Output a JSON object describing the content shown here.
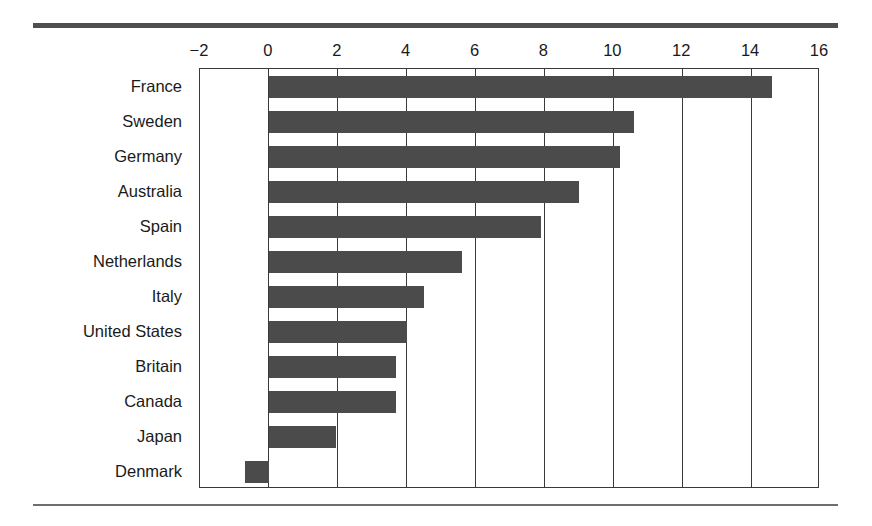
{
  "chart_data": {
    "type": "bar",
    "orientation": "horizontal",
    "title": "",
    "subtitle": "",
    "xlabel": "",
    "ylabel": "",
    "categories": [
      "France",
      "Sweden",
      "Germany",
      "Australia",
      "Spain",
      "Netherlands",
      "Italy",
      "United States",
      "Britain",
      "Canada",
      "Japan",
      "Denmark"
    ],
    "values": [
      14.6,
      10.6,
      10.2,
      9.0,
      7.9,
      5.6,
      4.5,
      4.0,
      3.7,
      3.7,
      1.95,
      -0.7
    ],
    "xlim": [
      -2,
      16
    ],
    "xticks": [
      -2,
      0,
      2,
      4,
      6,
      8,
      10,
      12,
      14,
      16
    ],
    "xtick_labels": [
      "−2",
      "0",
      "2",
      "4",
      "6",
      "8",
      "10",
      "12",
      "14",
      "16"
    ],
    "grid": "vertical-at-xticks",
    "legend": "none",
    "bar_color": "#4b4b4b",
    "frame_color": "#3a3a3a",
    "background_color": "#ffffff"
  },
  "decor": {
    "top_rule_color": "#4f4f4f",
    "bottom_rule_color": "#6e6e6e"
  }
}
